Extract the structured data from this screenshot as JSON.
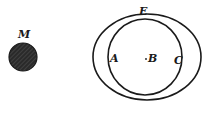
{
  "diagram": {
    "labels": {
      "mass": "M",
      "outer_top": "E",
      "inner_left": "A",
      "center": "B",
      "inner_right": "C"
    },
    "colors": {
      "ink": "#1a1a1a",
      "mass_fill": "#2a2a2a",
      "background": "#ffffff"
    }
  }
}
